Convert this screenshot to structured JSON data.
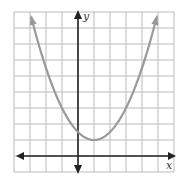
{
  "chart_data": {
    "type": "line",
    "title": "",
    "xlabel": "x",
    "ylabel": "y",
    "equation": "y = 0.5(x - 1)^2 + 1",
    "vertex": [
      1,
      1
    ],
    "y_intercept": 1.5,
    "xlim": [
      -4,
      6
    ],
    "ylim": [
      -1,
      9
    ],
    "grid": true,
    "grid_step": 1,
    "series": [
      {
        "name": "parabola",
        "x": [
          -3.5,
          -3,
          -2,
          -1,
          0,
          1,
          2,
          3,
          4,
          5,
          5.5
        ],
        "values": [
          11.125,
          9,
          5.5,
          3,
          1.5,
          1,
          1.5,
          3,
          5.5,
          9,
          11.125
        ]
      }
    ],
    "colors": {
      "curve": "#999999",
      "axes": "#222222",
      "grid": "#bbbbbb"
    }
  },
  "labels": {
    "x": "x",
    "y": "y"
  }
}
